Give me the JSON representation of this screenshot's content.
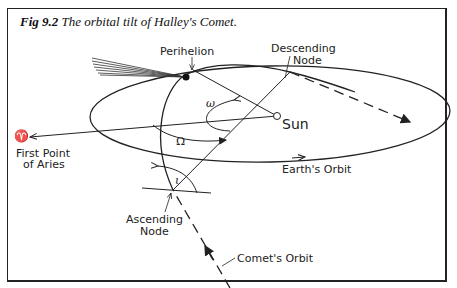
{
  "figure": {
    "number_label": "Fig 9.2",
    "title": "The orbital tilt of Halley's Comet."
  },
  "labels": {
    "perihelion": "Perihelion",
    "descending_node_line1": "Descending",
    "descending_node_line2": "Node",
    "sun": "Sun",
    "aries_symbol": "♈",
    "first_point_line1": "First Point",
    "first_point_line2": "of Aries",
    "earths_orbit": "Earth's Orbit",
    "ascending_node_line1": "Ascending",
    "ascending_node_line2": "Node",
    "comets_orbit": "Comet's Orbit",
    "omega_small": "ω",
    "omega_capital": "Ω",
    "inclination": "ι"
  },
  "colors": {
    "ink": "#222222",
    "background": "#ffffff"
  }
}
